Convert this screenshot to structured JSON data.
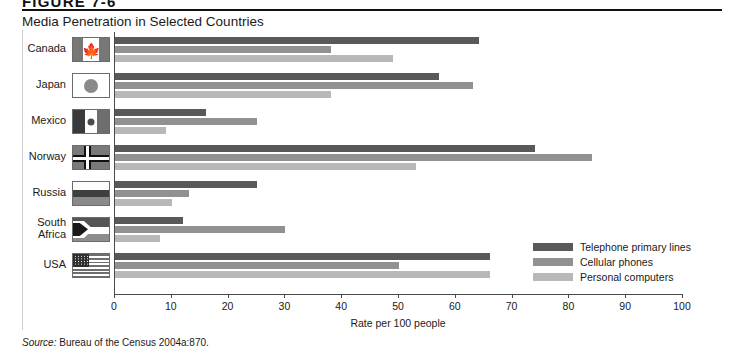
{
  "figure": {
    "label": "FIGURE 7-6",
    "title": "Media Penetration in Selected Countries"
  },
  "source": {
    "prefix": "Source:",
    "text": "Bureau of the Census 2004a:870."
  },
  "legend": {
    "position": "right-middle",
    "items": [
      {
        "label": "Telephone primary lines",
        "color": "#595959",
        "key": "telephone-primary-lines"
      },
      {
        "label": "Cellular phones",
        "color": "#919191",
        "key": "cellular-phones"
      },
      {
        "label": "Personal computers",
        "color": "#b8b8b8",
        "key": "personal-computers"
      }
    ]
  },
  "axis": {
    "title": "Rate per 100 people",
    "ticks": [
      "0",
      "10",
      "20",
      "30",
      "40",
      "50",
      "60",
      "70",
      "80",
      "90",
      "100"
    ]
  },
  "rows": [
    {
      "country": "Canada",
      "line1": "Canada",
      "line2": "",
      "flag": "canada-flag-icon"
    },
    {
      "country": "Japan",
      "line1": "Japan",
      "line2": "",
      "flag": "japan-flag-icon"
    },
    {
      "country": "Mexico",
      "line1": "Mexico",
      "line2": "",
      "flag": "mexico-flag-icon"
    },
    {
      "country": "Norway",
      "line1": "Norway",
      "line2": "",
      "flag": "norway-flag-icon"
    },
    {
      "country": "Russia",
      "line1": "Russia",
      "line2": "",
      "flag": "russia-flag-icon"
    },
    {
      "country": "South Africa",
      "line1": "South",
      "line2": "Africa",
      "flag": "south-africa-flag-icon"
    },
    {
      "country": "USA",
      "line1": "USA",
      "line2": "",
      "flag": "usa-flag-icon"
    }
  ],
  "chart_data": {
    "type": "bar",
    "orientation": "horizontal",
    "title": "Media Penetration in Selected Countries",
    "xlabel": "Rate per 100 people",
    "ylabel": "",
    "xlim": [
      0,
      100
    ],
    "xticks": [
      0,
      10,
      20,
      30,
      40,
      50,
      60,
      70,
      80,
      90,
      100
    ],
    "grid": false,
    "legend_position": "right-middle",
    "categories": [
      "Canada",
      "Japan",
      "Mexico",
      "Norway",
      "Russia",
      "South Africa",
      "USA"
    ],
    "series": [
      {
        "name": "Telephone primary lines",
        "color": "#595959",
        "values": [
          64,
          57,
          16,
          74,
          25,
          12,
          66
        ]
      },
      {
        "name": "Cellular phones",
        "color": "#919191",
        "values": [
          38,
          63,
          25,
          84,
          13,
          30,
          50
        ]
      },
      {
        "name": "Personal computers",
        "color": "#b8b8b8",
        "values": [
          49,
          38,
          9,
          53,
          10,
          8,
          66
        ]
      }
    ]
  }
}
